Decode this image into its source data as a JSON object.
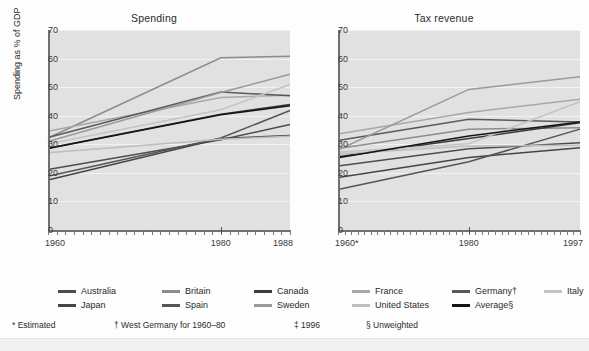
{
  "figure": {
    "ylabel": "Spending as % of GDP",
    "y_ticks": [
      "0",
      "10",
      "20",
      "30",
      "40",
      "50",
      "60",
      "70"
    ]
  },
  "panels": [
    {
      "title": "Spending",
      "x_ticks": [
        "1960",
        "1980",
        "1988"
      ]
    },
    {
      "title": "Tax revenue",
      "x_ticks": [
        "1960*",
        "1980",
        "1997"
      ]
    }
  ],
  "legend": {
    "row0": [
      {
        "label": "Australia",
        "color": "#4d4d4d"
      },
      {
        "label": "Britain",
        "color": "#8c8c8c"
      },
      {
        "label": "Canada",
        "color": "#3a3a3a"
      },
      {
        "label": "France",
        "color": "#a8a8a8"
      },
      {
        "label": "Germany†",
        "color": "#5a5a5a"
      },
      {
        "label": "Italy",
        "color": "#c4c4c4"
      }
    ],
    "row1": [
      {
        "label": "Japan",
        "color": "#454545"
      },
      {
        "label": "Spain",
        "color": "#555555"
      },
      {
        "label": "Sweden",
        "color": "#9a9a9a"
      },
      {
        "label": "United States",
        "color": "#bdbdbd"
      },
      {
        "label": "Average§",
        "color": "#141414"
      }
    ]
  },
  "footnotes": [
    "* Estimated",
    "† West Germany for 1960–80",
    "‡ 1996",
    "§ Unweighted"
  ],
  "chart_data": [
    {
      "type": "line",
      "title": "Spending",
      "xlabel": "",
      "ylabel": "Spending as % of GDP",
      "x": [
        1960,
        1980,
        1988
      ],
      "x_tick_labels": [
        "1960",
        "1980",
        "1988"
      ],
      "xlim": [
        1960,
        1988
      ],
      "ylim": [
        0,
        70
      ],
      "y_ticks": [
        0,
        10,
        20,
        30,
        40,
        50,
        60,
        70
      ],
      "grid": true,
      "legend_position": "below-figure",
      "series": [
        {
          "name": "Australia",
          "color": "#4d4d4d",
          "values": [
            21.2,
            31.6,
            36.9
          ]
        },
        {
          "name": "Britain",
          "color": "#8c8c8c",
          "values": [
            32.2,
            60.3,
            60.8
          ]
        },
        {
          "name": "Canada",
          "color": "#3a3a3a",
          "values": [
            28.6,
            40.5,
            43.9
          ]
        },
        {
          "name": "France",
          "color": "#a8a8a8",
          "values": [
            34.6,
            46.4,
            47.2
          ]
        },
        {
          "name": "Germany†",
          "color": "#5a5a5a",
          "values": [
            32.4,
            48.3,
            47.0
          ]
        },
        {
          "name": "Italy",
          "color": "#c4c4c4",
          "values": [
            30.1,
            42.1,
            50.9
          ]
        },
        {
          "name": "Japan",
          "color": "#454545",
          "values": [
            17.5,
            32.0,
            33.1
          ]
        },
        {
          "name": "Spain",
          "color": "#555555",
          "values": [
            18.8,
            32.2,
            41.8
          ]
        },
        {
          "name": "Sweden",
          "color": "#9a9a9a",
          "values": [
            31.0,
            48.1,
            54.5
          ]
        },
        {
          "name": "United States",
          "color": "#bdbdbd",
          "values": [
            27.0,
            31.8,
            32.8
          ]
        },
        {
          "name": "Average§",
          "color": "#141414",
          "values": [
            28.5,
            40.3,
            43.5
          ]
        }
      ]
    },
    {
      "type": "line",
      "title": "Tax revenue",
      "xlabel": "",
      "ylabel": "Spending as % of GDP",
      "x": [
        1960,
        1980,
        1997
      ],
      "x_tick_labels": [
        "1960*",
        "1980",
        "1997"
      ],
      "xlim": [
        1960,
        1997
      ],
      "ylim": [
        0,
        70
      ],
      "y_ticks": [
        0,
        10,
        20,
        30,
        40,
        50,
        60,
        70
      ],
      "grid": true,
      "legend_position": "below-figure",
      "series": [
        {
          "name": "Australia",
          "color": "#4d4d4d",
          "values": [
            22.4,
            28.4,
            30.5
          ]
        },
        {
          "name": "Britain",
          "color": "#8c8c8c",
          "values": [
            28.5,
            35.3,
            35.8
          ]
        },
        {
          "name": "Canada",
          "color": "#3a3a3a",
          "values": [
            25.6,
            32.0,
            37.5
          ]
        },
        {
          "name": "France",
          "color": "#a8a8a8",
          "values": [
            33.6,
            41.1,
            45.8
          ]
        },
        {
          "name": "Germany†",
          "color": "#5a5a5a",
          "values": [
            31.3,
            38.8,
            37.8
          ]
        },
        {
          "name": "Italy",
          "color": "#c4c4c4",
          "values": [
            27.2,
            30.2,
            44.9
          ]
        },
        {
          "name": "Japan",
          "color": "#454545",
          "values": [
            18.4,
            25.4,
            28.8
          ]
        },
        {
          "name": "Spain",
          "color": "#555555",
          "values": [
            14.2,
            23.9,
            35.3
          ]
        },
        {
          "name": "Sweden",
          "color": "#9a9a9a",
          "values": [
            28.0,
            49.2,
            53.6
          ]
        },
        {
          "name": "United States",
          "color": "#bdbdbd",
          "values": [
            26.6,
            29.4,
            29.7
          ]
        },
        {
          "name": "Average§",
          "color": "#141414",
          "values": [
            25.3,
            32.9,
            37.8
          ]
        }
      ]
    }
  ]
}
